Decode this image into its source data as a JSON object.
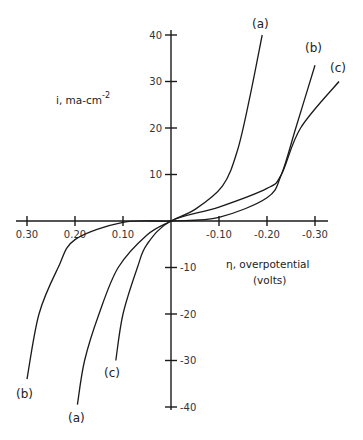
{
  "chart_data": {
    "type": "line",
    "title": "",
    "xlabel": "η, overpotential (volts)",
    "ylabel": "i, ma-cm^-2",
    "xlim": [
      0.33,
      -0.33
    ],
    "ylim": [
      -42,
      42
    ],
    "grid": false,
    "x_ticks": [
      0.3,
      0.2,
      0.1,
      -0.1,
      -0.2,
      -0.3
    ],
    "x_tick_labels": [
      "0.30",
      "0.20",
      "0.10",
      "-0.10",
      "-0.20",
      "-0.30"
    ],
    "y_ticks": [
      40,
      30,
      20,
      10,
      -10,
      -20,
      -30,
      -40
    ],
    "y_tick_labels": [
      "40",
      "30",
      "20",
      "10",
      "-10",
      "-20",
      "-30",
      "-40"
    ],
    "series": [
      {
        "name": "(a)",
        "x": [
          0.195,
          0.18,
          0.15,
          0.11,
          0.05,
          0.0,
          -0.05,
          -0.107,
          -0.138,
          -0.163,
          -0.19
        ],
        "y": [
          -39.5,
          -30,
          -20,
          -10,
          -3,
          0,
          2.5,
          7.5,
          15,
          26,
          40
        ]
      },
      {
        "name": "(b)",
        "x": [
          0.3,
          0.275,
          0.235,
          0.2,
          0.1,
          0.0,
          -0.1,
          -0.2,
          -0.23,
          -0.26,
          -0.3
        ],
        "y": [
          -34,
          -20,
          -10,
          -4,
          -0.3,
          0,
          0.8,
          5,
          10,
          20,
          33.5
        ]
      },
      {
        "name": "(c)",
        "x": [
          0.115,
          0.1,
          0.07,
          0.05,
          0.0,
          -0.1,
          -0.2,
          -0.23,
          -0.27,
          -0.35
        ],
        "y": [
          -30,
          -20,
          -10,
          -5,
          0,
          3,
          7,
          10,
          20,
          30
        ]
      }
    ],
    "annotations": [
      {
        "text": "(a)",
        "near": "top end of curve a"
      },
      {
        "text": "(b)",
        "near": "top end of curve b"
      },
      {
        "text": "(c)",
        "near": "top end of curve c"
      },
      {
        "text": "(b)",
        "near": "bottom end of curve b"
      },
      {
        "text": "(a)",
        "near": "bottom end of curve a"
      },
      {
        "text": "(c)",
        "near": "bottom end of curve c"
      }
    ],
    "legend": "none (curves labeled inline)"
  },
  "labels": {
    "y_axis_text": "i, ma-cm",
    "y_axis_exp": "-2",
    "x_axis_line1": "η, overpotential",
    "x_axis_line2": "(volts)",
    "curve_a": "(a)",
    "curve_b": "(b)",
    "curve_c": "(c)"
  }
}
